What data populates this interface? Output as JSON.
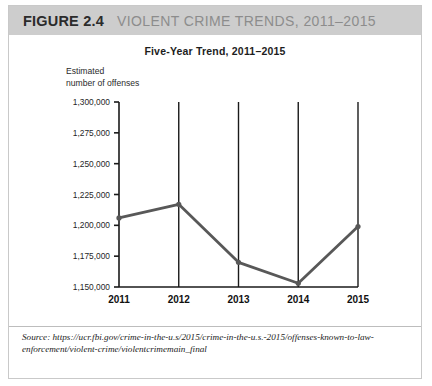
{
  "figure": {
    "number": "FIGURE 2.4",
    "title": "VIOLENT CRIME TRENDS, 2011–2015",
    "source": "Source: https://ucr.fbi.gov/crime-in-the-u.s/2015/crime-in-the-u.s.-2015/offenses-known-to-law-enforcement/violent-crime/violentcrimemain_final"
  },
  "colors": {
    "header_band": "#cdcdcd",
    "fig_number": "#2b2b2b",
    "fig_title": "#8c8c8c",
    "line": "#585858",
    "axis": "#1a1a1a",
    "gridline": "#1a1a1a",
    "border": "#c9c9c9"
  },
  "axis_label": {
    "line1": "Estimated",
    "line2": "number of offenses"
  },
  "chart_data": {
    "type": "line",
    "title": "Five-Year Trend, 2011–2015",
    "xlabel": "",
    "ylabel": "Estimated number of offenses",
    "categories": [
      "2011",
      "2012",
      "2013",
      "2014",
      "2015"
    ],
    "values": [
      1206000,
      1217000,
      1170000,
      1153000,
      1199000
    ],
    "ylim": [
      1150000,
      1300000
    ],
    "ytick_values": [
      1300000,
      1275000,
      1250000,
      1225000,
      1200000,
      1175000,
      1150000
    ],
    "ytick_labels": [
      "1,300,000",
      "1,275,000",
      "1,250,000",
      "1,225,000",
      "1,200,000",
      "1,175,000",
      "1,150,000"
    ],
    "grid": "vertical",
    "legend": "none",
    "markers": true
  }
}
